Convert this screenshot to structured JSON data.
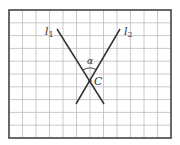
{
  "figure": {
    "type": "geometry-diagram",
    "background_color": "#ffffff",
    "frame": {
      "x": 9,
      "y": 10,
      "width": 162,
      "height": 128,
      "color": "#444444"
    },
    "grid": {
      "columns": 12,
      "rows": 10,
      "color": "#bdbdbd"
    },
    "lines": [
      {
        "name": "l1",
        "label": "l",
        "subscript": "1",
        "x1": 57,
        "y1": 29,
        "x2": 104,
        "y2": 104,
        "label_x": 45,
        "label_y": 35
      },
      {
        "name": "l2",
        "label": "l",
        "subscript": "2",
        "x1": 120,
        "y1": 29,
        "x2": 76,
        "y2": 104,
        "label_x": 124,
        "label_y": 35
      }
    ],
    "line_color": "#333333",
    "intersection": {
      "label": "C",
      "x": 90,
      "y": 81,
      "label_x": 94,
      "label_y": 85
    },
    "angle": {
      "label": "α",
      "label_x": 87,
      "label_y": 64,
      "arc_radius": 13
    }
  }
}
